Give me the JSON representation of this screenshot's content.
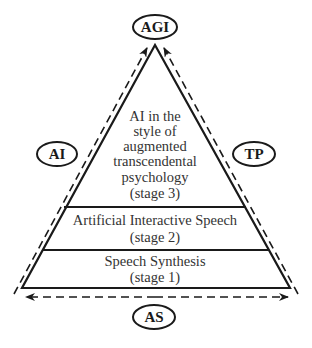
{
  "diagram": {
    "type": "pyramid",
    "nodes": {
      "top": {
        "label": "AGI"
      },
      "left": {
        "label": "AI"
      },
      "right": {
        "label": "TP"
      },
      "bottom": {
        "label": "AS"
      }
    },
    "stages": [
      {
        "level": 3,
        "lines": [
          "AI in the",
          "style of",
          "augmented",
          "transcendental",
          "psychology",
          "(stage 3)"
        ]
      },
      {
        "level": 2,
        "lines": [
          "Artificial Interactive Speech",
          "(stage 2)"
        ]
      },
      {
        "level": 1,
        "lines": [
          "Speech Synthesis",
          "(stage 1)"
        ]
      }
    ],
    "arrows": [
      {
        "from": "base-left",
        "to": "apex",
        "style": "dashed",
        "side": "left"
      },
      {
        "from": "base-right",
        "to": "apex",
        "style": "dashed",
        "side": "right"
      },
      {
        "from": "center",
        "to": "both-ends",
        "style": "dashed",
        "side": "bottom"
      }
    ],
    "colors": {
      "stroke": "#1a1a1a",
      "text": "#333333",
      "background": "#ffffff"
    }
  }
}
